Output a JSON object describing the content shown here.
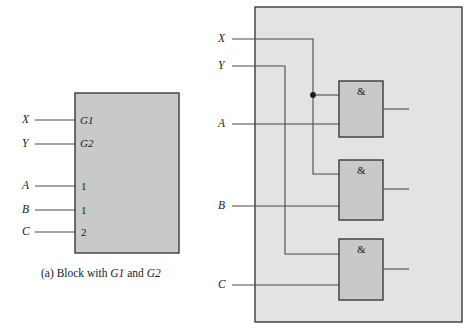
{
  "figure": {
    "caption_a": "(a) Block with G1 and G2",
    "caption_a_prefix": "(a) Block with ",
    "caption_a_mid": " and ",
    "block_label_g1": "G1",
    "block_label_g2": "G2"
  },
  "block_diagram": {
    "inputs": [
      {
        "signal": "X",
        "pin": "G1"
      },
      {
        "signal": "Y",
        "pin": "G2"
      },
      {
        "signal": "A",
        "pin": "1"
      },
      {
        "signal": "B",
        "pin": "1"
      },
      {
        "signal": "C",
        "pin": "2"
      }
    ]
  },
  "gate_diagram": {
    "inputs": [
      {
        "signal": "X"
      },
      {
        "signal": "Y"
      },
      {
        "signal": "A"
      },
      {
        "signal": "B"
      },
      {
        "signal": "C"
      }
    ],
    "gates": [
      {
        "symbol": "&"
      },
      {
        "symbol": "&"
      },
      {
        "symbol": "&"
      }
    ]
  },
  "colors": {
    "fill_block": "#c9c9c9",
    "fill_outer": "#e3e3e3",
    "fill_gate": "#c9c9c9",
    "stroke": "#3a3a3a",
    "wire": "#4a4a4a",
    "text": "#1a1a1a"
  }
}
